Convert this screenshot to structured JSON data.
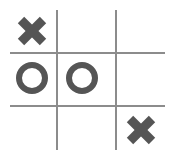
{
  "game": {
    "title": "Tic-Tac-Toe",
    "board": [
      [
        "X",
        "",
        ""
      ],
      [
        "O",
        "O",
        ""
      ],
      [
        "",
        "",
        "X"
      ]
    ],
    "colors": {
      "mark": "#555555",
      "grid": "#8c8c8c",
      "background": "#ffffff"
    }
  }
}
